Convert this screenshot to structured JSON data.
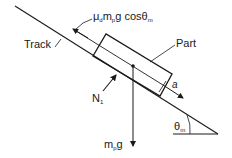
{
  "diagram": {
    "labels": {
      "friction": "μ",
      "friction_sub_d": "d",
      "friction_m": "m",
      "friction_sub_p": "p",
      "friction_rest": "g cosθ",
      "friction_sub_m": "m",
      "track": "Track",
      "part": "Part",
      "accel": "a",
      "normal": "N",
      "normal_sub": "1",
      "weight_m": "m",
      "weight_sub": "p",
      "weight_g": "g",
      "angle": "θ",
      "angle_sub": "m"
    },
    "colors": {
      "ink": "#1a1a1a",
      "background": "#ffffff"
    }
  }
}
